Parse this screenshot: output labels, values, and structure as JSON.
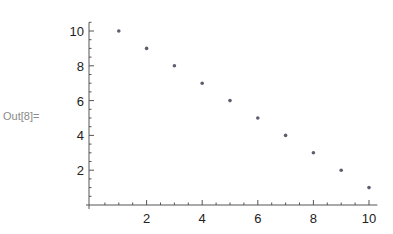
{
  "cell": {
    "output_label": "Out[8]="
  },
  "colors": {
    "axis": "#555555",
    "point": "#5e5e6e",
    "label": "#222222",
    "out_label": "#8a8a8a"
  },
  "chart_data": {
    "type": "scatter",
    "title": "",
    "xlabel": "",
    "ylabel": "",
    "x": [
      1,
      2,
      3,
      4,
      5,
      6,
      7,
      8,
      9,
      10
    ],
    "series": [
      {
        "name": "",
        "values": [
          10,
          9,
          8,
          7,
          6,
          5,
          4,
          3,
          2,
          1
        ]
      }
    ],
    "x_ticks": [
      2,
      4,
      6,
      8,
      10
    ],
    "y_ticks": [
      2,
      4,
      6,
      8,
      10
    ],
    "xlim": [
      0,
      10.3
    ],
    "ylim": [
      0,
      10.5
    ],
    "grid": false,
    "legend": "none"
  }
}
